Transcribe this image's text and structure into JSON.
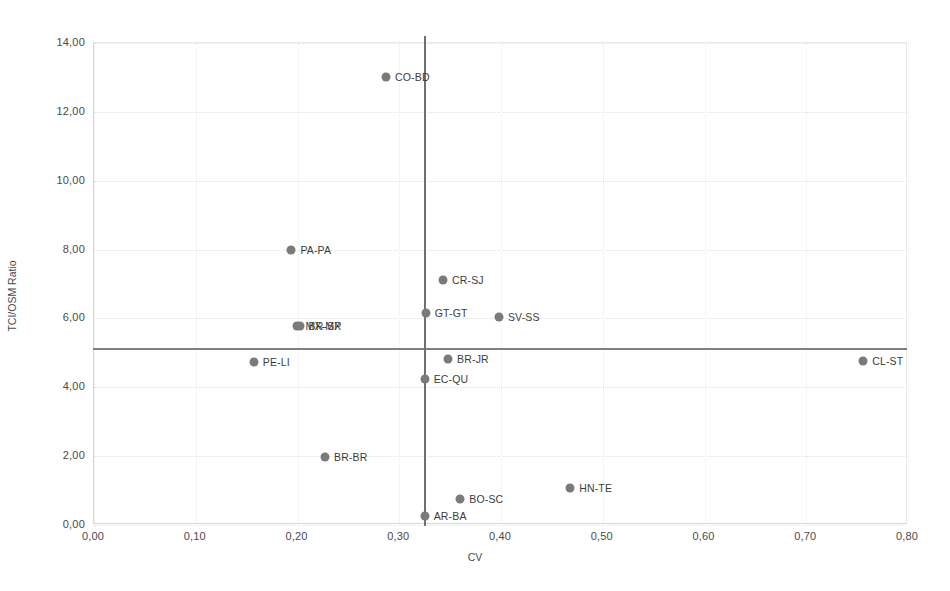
{
  "chart_data": {
    "type": "scatter",
    "title": "",
    "xlabel": "CV",
    "ylabel": "TCI/OSM Ratio",
    "xlim": [
      0.0,
      0.8
    ],
    "ylim": [
      0.0,
      14.0
    ],
    "xticks": [
      "0,00",
      "0,10",
      "0,20",
      "0,30",
      "0,40",
      "0,50",
      "0,60",
      "0,70",
      "0,80"
    ],
    "xtick_values": [
      0.0,
      0.1,
      0.2,
      0.3,
      0.4,
      0.5,
      0.6,
      0.7,
      0.8
    ],
    "yticks": [
      "0,00",
      "2,00",
      "4,00",
      "6,00",
      "8,00",
      "10,00",
      "12,00",
      "14,00"
    ],
    "ytick_values": [
      0,
      2,
      4,
      6,
      8,
      10,
      12,
      14
    ],
    "grid": true,
    "legend": "none",
    "marker_color": "#7a7a7a",
    "reference_lines": {
      "horizontal_value": 5.1,
      "vertical_value": 0.325,
      "color": "#7a7a7a"
    },
    "points": [
      {
        "label": "CO-BD",
        "x": 0.288,
        "y": 12.97,
        "label_side": "right"
      },
      {
        "label": "PA-PA",
        "x": 0.195,
        "y": 7.95,
        "label_side": "right"
      },
      {
        "label": "CR-SJ",
        "x": 0.344,
        "y": 7.08,
        "label_side": "right"
      },
      {
        "label": "GT-GT",
        "x": 0.327,
        "y": 6.12,
        "label_side": "right"
      },
      {
        "label": "SV-SS",
        "x": 0.399,
        "y": 6.02,
        "label_side": "right"
      },
      {
        "label": "MX-MX",
        "x": 0.2,
        "y": 5.74,
        "label_side": "right"
      },
      {
        "label": "BR-SP",
        "x": 0.203,
        "y": 5.74,
        "label_side": "right"
      },
      {
        "label": "PE-LI",
        "x": 0.158,
        "y": 4.7,
        "label_side": "right"
      },
      {
        "label": "BR-JR",
        "x": 0.349,
        "y": 4.78,
        "label_side": "right"
      },
      {
        "label": "CL-ST",
        "x": 0.757,
        "y": 4.72,
        "label_side": "right"
      },
      {
        "label": "EC-QU",
        "x": 0.326,
        "y": 4.22,
        "label_side": "right"
      },
      {
        "label": "BR-BR",
        "x": 0.228,
        "y": 1.95,
        "label_side": "right"
      },
      {
        "label": "HN-TE",
        "x": 0.469,
        "y": 1.05,
        "label_side": "right"
      },
      {
        "label": "BO-SC",
        "x": 0.361,
        "y": 0.72,
        "label_side": "right"
      },
      {
        "label": "AR-BA",
        "x": 0.326,
        "y": 0.23,
        "label_side": "right"
      }
    ]
  }
}
